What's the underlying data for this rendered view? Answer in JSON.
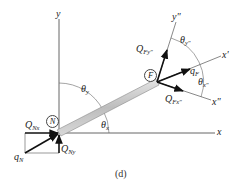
{
  "figure": {
    "caption": "(d)",
    "axes": {
      "x_label": "x",
      "y_label": "y",
      "x_prime_label": "x'",
      "x_double_prime_label": "x\"",
      "y_double_prime_label": "y\""
    },
    "nodes": [
      {
        "id": "N",
        "label": "N"
      },
      {
        "id": "F",
        "label": "F"
      }
    ],
    "forces": {
      "QNx": {
        "main": "Q",
        "sub": "Nx"
      },
      "QNy": {
        "main": "Q",
        "sub": "Ny"
      },
      "qN": {
        "main": "q",
        "sub": "N"
      },
      "QFy": {
        "main": "Q",
        "sub": "Fy\""
      },
      "qF": {
        "main": "q",
        "sub": "F"
      },
      "QFx": {
        "main": "Q",
        "sub": "Fx\""
      }
    },
    "angles": {
      "theta_y": {
        "main": "θ",
        "sub": "y"
      },
      "theta_x": {
        "main": "θ",
        "sub": "x"
      },
      "theta_y2": {
        "main": "θ",
        "sub": "y\""
      },
      "theta_x2": {
        "main": "θ",
        "sub": "x\""
      }
    },
    "colors": {
      "line": "#444444",
      "arrow": "#111111",
      "rod_fill": "#c8c8c8",
      "rod_edge": "#888888"
    }
  }
}
